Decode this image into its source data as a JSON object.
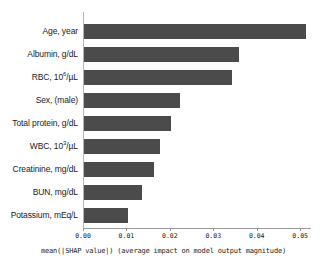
{
  "chart_data": {
    "type": "bar",
    "orientation": "horizontal",
    "title": "",
    "subtitle": "",
    "xlabel": "mean(|SHAP value|) (average impact on model output magnitude)",
    "ylabel": "",
    "xlim": [
      0.0,
      0.0525
    ],
    "xticks": [
      0.0,
      0.01,
      0.02,
      0.03,
      0.04,
      0.05
    ],
    "xtick_labels": [
      "0.00",
      "0.01",
      "0.02",
      "0.03",
      "0.04",
      "0.05"
    ],
    "grid": false,
    "legend": null,
    "bar_color": "#4b4b4b",
    "categories": [
      "Age, year",
      "Albumin, g/dL",
      "RBC, 10^6/µL",
      "Sex, (male)",
      "Total protein, g/dL",
      "WBC, 10^3/µL",
      "Creatinine, mg/dL",
      "BUN, mg/dL",
      "Potassium, mEq/L"
    ],
    "values": [
      0.0512,
      0.0357,
      0.0341,
      0.0221,
      0.02,
      0.0175,
      0.0161,
      0.0134,
      0.0101
    ],
    "bars": [
      {
        "label_html": "Age, year",
        "label_plain": "Age, year",
        "value": 0.0512
      },
      {
        "label_html": "Albumin, g/dL",
        "label_plain": "Albumin, g/dL",
        "value": 0.0357
      },
      {
        "label_html": "RBC, 10<sup>6</sup>/µL",
        "label_plain": "RBC, 10^6/µL",
        "value": 0.0341
      },
      {
        "label_html": "Sex, (male)",
        "label_plain": "Sex, (male)",
        "value": 0.0221
      },
      {
        "label_html": "Total protein, g/dL",
        "label_plain": "Total protein, g/dL",
        "value": 0.02
      },
      {
        "label_html": "WBC, 10<sup>3</sup>/µL",
        "label_plain": "WBC, 10^3/µL",
        "value": 0.0175
      },
      {
        "label_html": "Creatinine, mg/dL",
        "label_plain": "Creatinine, mg/dL",
        "value": 0.0161
      },
      {
        "label_html": "BUN, mg/dL",
        "label_plain": "BUN, mg/dL",
        "value": 0.0134
      },
      {
        "label_html": "Potassium, mEq/L",
        "label_plain": "Potassium, mEq/L",
        "value": 0.0101
      }
    ]
  }
}
